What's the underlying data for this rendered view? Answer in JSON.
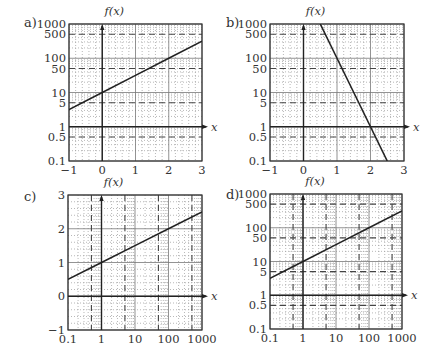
{
  "figure": {
    "panels_count": 4,
    "colors": {
      "line": "#222222",
      "frame": "#333333",
      "major_grid": "#777777",
      "minor_grid": "#9a9a9a",
      "dashed": "#444444",
      "text": "#333333"
    }
  },
  "chart_data": [
    {
      "panel": "a)",
      "type": "line",
      "title": "f(x)",
      "xlabel": "x",
      "ylabel": "f(x)",
      "xscale": "linear",
      "yscale": "log",
      "xlim": [
        -1,
        3
      ],
      "ylim": [
        0.1,
        1000
      ],
      "xticks": [
        -1,
        0,
        1,
        2,
        3
      ],
      "xtick_labels": [
        "−1",
        "0",
        "1",
        "2",
        "3"
      ],
      "yticks": [
        0.1,
        0.5,
        1,
        5,
        10,
        50,
        100,
        500,
        1000
      ],
      "ytick_labels": [
        "0.1",
        "0.5",
        "1",
        "5",
        "10",
        "50",
        "100",
        "500",
        "1000"
      ],
      "dashed_y": [
        0.5,
        5,
        50,
        500
      ],
      "dashed_x": [],
      "grid": true,
      "series": [
        {
          "name": "f(x) = 10·10^(x/2)",
          "x": [
            -1,
            0,
            1,
            2,
            3
          ],
          "y": [
            3.16,
            10,
            31.6,
            100,
            316
          ]
        }
      ],
      "axis_origin": {
        "x": 0,
        "y": 1
      }
    },
    {
      "panel": "b)",
      "type": "line",
      "title": "f(x)",
      "xlabel": "x",
      "ylabel": "f(x)",
      "xscale": "linear",
      "yscale": "log",
      "xlim": [
        -1,
        3
      ],
      "ylim": [
        0.1,
        1000
      ],
      "xticks": [
        -1,
        0,
        1,
        2,
        3
      ],
      "xtick_labels": [
        "−1",
        "0",
        "1",
        "2",
        "3"
      ],
      "yticks": [
        0.1,
        0.5,
        1,
        5,
        10,
        50,
        100,
        500,
        1000
      ],
      "ytick_labels": [
        "0.1",
        "0.5",
        "1",
        "5",
        "10",
        "50",
        "100",
        "500",
        "1000"
      ],
      "dashed_y": [
        0.5,
        5,
        50,
        500
      ],
      "dashed_x": [],
      "grid": true,
      "series": [
        {
          "name": "f(x) = 10^(4−2x)",
          "x": [
            0.5,
            1,
            1.5,
            2,
            2.5
          ],
          "y": [
            1000,
            100,
            10,
            1,
            0.1
          ]
        }
      ],
      "axis_origin": {
        "x": 0,
        "y": 1
      }
    },
    {
      "panel": "c)",
      "type": "line",
      "title": "f(x)",
      "xlabel": "x",
      "ylabel": "f(x)",
      "xscale": "log",
      "yscale": "linear",
      "xlim": [
        0.1,
        1000
      ],
      "ylim": [
        -1,
        3
      ],
      "xticks": [
        0.1,
        1,
        10,
        100,
        1000
      ],
      "xtick_labels": [
        "0.1",
        "1",
        "10",
        "100",
        "1000"
      ],
      "yticks": [
        -1,
        0,
        1,
        2,
        3
      ],
      "ytick_labels": [
        "−1",
        "0",
        "1",
        "2",
        "3"
      ],
      "dashed_y": [],
      "dashed_x": [
        0.5,
        5,
        50,
        500
      ],
      "grid": true,
      "series": [
        {
          "name": "f(x) = 1 + 0.5·log10(x)",
          "x": [
            0.1,
            1,
            10,
            100,
            1000
          ],
          "y": [
            0.5,
            1,
            1.5,
            2,
            2.5
          ]
        }
      ],
      "axis_origin": {
        "x": 1,
        "y": 0
      }
    },
    {
      "panel": "d)",
      "type": "line",
      "title": "f(x)",
      "xlabel": "x",
      "ylabel": "f(x)",
      "xscale": "log",
      "yscale": "log",
      "xlim": [
        0.1,
        1000
      ],
      "ylim": [
        0.1,
        1000
      ],
      "xticks": [
        0.1,
        1,
        10,
        100,
        1000
      ],
      "xtick_labels": [
        "0.1",
        "1",
        "10",
        "100",
        "1000"
      ],
      "yticks": [
        0.1,
        0.5,
        1,
        5,
        10,
        50,
        100,
        500,
        1000
      ],
      "ytick_labels": [
        "0.1",
        "0.5",
        "1",
        "5",
        "10",
        "50",
        "100",
        "500",
        "1000"
      ],
      "dashed_y": [
        0.5,
        5,
        50,
        500
      ],
      "dashed_x": [
        0.5,
        5,
        50,
        500
      ],
      "grid": true,
      "series": [
        {
          "name": "f(x) = 10·√x",
          "x": [
            0.1,
            1,
            10,
            100,
            1000
          ],
          "y": [
            3.16,
            10,
            31.6,
            100,
            316
          ]
        }
      ],
      "axis_origin": {
        "x": 1,
        "y": 1
      }
    }
  ],
  "layout": [
    {
      "left": 69,
      "top": 24,
      "right": 202,
      "bottom": 161,
      "label_x": 24,
      "label_y": 27
    },
    {
      "left": 270,
      "top": 24,
      "right": 404,
      "bottom": 161,
      "label_x": 226,
      "label_y": 27
    },
    {
      "left": 68,
      "top": 195,
      "right": 202,
      "bottom": 330,
      "label_x": 24,
      "label_y": 201
    },
    {
      "left": 270,
      "top": 194,
      "right": 402,
      "bottom": 329,
      "label_x": 226,
      "label_y": 199
    }
  ]
}
